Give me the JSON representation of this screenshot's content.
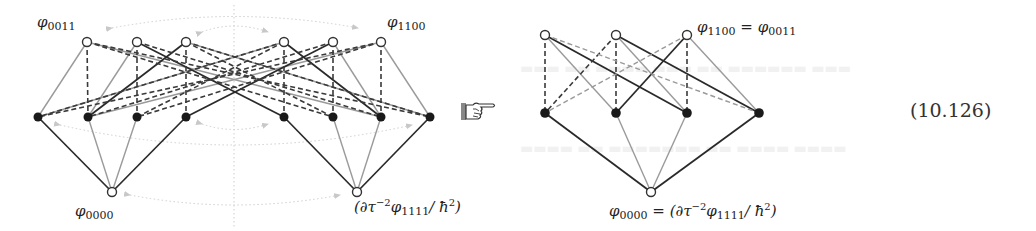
{
  "equation_number": "(10.126)",
  "colors": {
    "dark_edge": "#2a2a2a",
    "gray_edge": "#9a9a9a",
    "dashed_dark": "#3a3a3a",
    "dashed_gray": "#8c8c8c",
    "filled_node": "#1a1a1a",
    "open_node_stroke": "#333333",
    "dotted_arrow": "#c8c8c8"
  },
  "left_diagram": {
    "labels": {
      "top_left": {
        "base": "φ",
        "sub": "0011"
      },
      "top_right": {
        "base": "φ",
        "sub": "1100"
      },
      "bottom_left": {
        "base": "φ",
        "sub": "0000"
      },
      "bottom_right": {
        "prefix": "(∂τ",
        "sup": "−2",
        "base": "φ",
        "sub": "1111",
        "suffix": "/ ħ",
        "suffix_sup": "2",
        "close": ")"
      }
    },
    "nodes": {
      "top": [
        [
          87,
          42
        ],
        [
          137,
          42
        ],
        [
          186,
          42
        ],
        [
          284,
          42
        ],
        [
          333,
          42
        ],
        [
          381,
          42
        ]
      ],
      "middle": [
        [
          38,
          117
        ],
        [
          88,
          117
        ],
        [
          137,
          117
        ],
        [
          186,
          117
        ],
        [
          284,
          117
        ],
        [
          333,
          117
        ],
        [
          381,
          117
        ],
        [
          430,
          117
        ]
      ],
      "bottom": [
        [
          112,
          192
        ],
        [
          357,
          192
        ]
      ]
    }
  },
  "arrow_icon": "pointing-hand-icon",
  "right_diagram": {
    "labels": {
      "top": {
        "base": "φ",
        "sub": "1100",
        "eq": " = ",
        "base2": "φ",
        "sub2": "0011"
      },
      "bottom": {
        "base": "φ",
        "sub": "0000",
        "eq": " = ",
        "prefix": "(∂τ",
        "sup": "−2",
        "base2": "φ",
        "sub2": "1111",
        "suffix": "/ ħ",
        "suffix_sup": "2",
        "close": ")"
      }
    },
    "nodes": {
      "top": [
        [
          545,
          35
        ],
        [
          616,
          35
        ],
        [
          687,
          35
        ]
      ],
      "middle": [
        [
          545,
          113
        ],
        [
          616,
          113
        ],
        [
          687,
          113
        ],
        [
          759,
          113
        ]
      ],
      "bottom": [
        [
          651,
          192
        ]
      ]
    }
  }
}
